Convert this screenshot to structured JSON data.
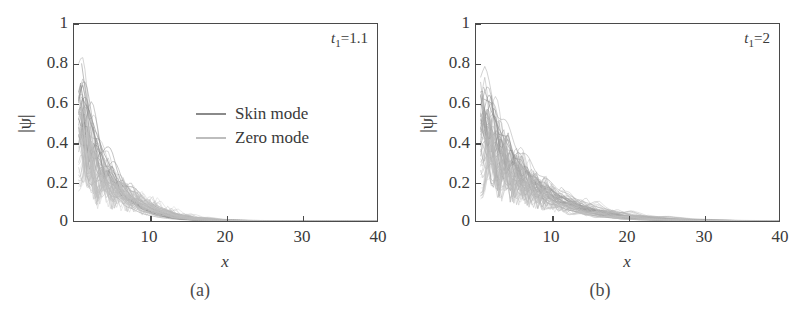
{
  "figure": {
    "panels": [
      {
        "caption": "(a)",
        "annotation": {
          "symbol": "t",
          "subscript": "1",
          "equals": "=",
          "value": "1.1"
        },
        "has_legend": true
      },
      {
        "caption": "(b)",
        "annotation": {
          "symbol": "t",
          "subscript": "1",
          "equals": "=",
          "value": "2"
        },
        "has_legend": false
      }
    ],
    "legend": {
      "items": [
        {
          "label": "Skin mode",
          "color": "#8a8a8a"
        },
        {
          "label": "Zero mode",
          "color": "#bdbdbd"
        }
      ]
    }
  },
  "chart_data": [
    {
      "type": "line",
      "title": "(a)",
      "xlabel": "x",
      "ylabel": "|ψ|",
      "xlim": [
        0,
        40
      ],
      "ylim": [
        0,
        1
      ],
      "xticks": [
        0,
        10,
        20,
        30,
        40
      ],
      "xticklabels": [
        "0",
        "10",
        "20",
        "30",
        "40"
      ],
      "yticks": [
        0,
        0.2,
        0.4,
        0.6,
        0.8,
        1
      ],
      "yticklabels": [
        "0",
        "0.2",
        "0.4",
        "0.6",
        "0.8",
        "1"
      ],
      "grid": false,
      "legend": [
        "Skin mode",
        "Zero mode"
      ],
      "legend_position": "center-right",
      "annotations": [
        "t_1=1.1"
      ],
      "series": [
        {
          "name": "Skin mode",
          "color": "#8a8a8a",
          "x": [
            1,
            2,
            3,
            4,
            5,
            6,
            7,
            8,
            9,
            10,
            11,
            12,
            13,
            14,
            15,
            16,
            18,
            20,
            25,
            30,
            40
          ],
          "values": [
            0.8,
            0.52,
            0.4,
            0.3,
            0.22,
            0.16,
            0.12,
            0.09,
            0.065,
            0.048,
            0.035,
            0.026,
            0.019,
            0.014,
            0.01,
            0.007,
            0.004,
            0.002,
            0.001,
            0.0,
            0.0
          ]
        },
        {
          "name": "Skin mode",
          "color": "#8a8a8a",
          "x": [
            1,
            2,
            3,
            4,
            5,
            6,
            7,
            8,
            9,
            10,
            11,
            12,
            13,
            14,
            15,
            16,
            18,
            20,
            25,
            30,
            40
          ],
          "values": [
            0.63,
            0.56,
            0.44,
            0.34,
            0.26,
            0.2,
            0.15,
            0.11,
            0.085,
            0.063,
            0.046,
            0.034,
            0.025,
            0.018,
            0.013,
            0.01,
            0.005,
            0.003,
            0.001,
            0.0,
            0.0
          ]
        },
        {
          "name": "Skin mode",
          "color": "#8a8a8a",
          "x": [
            1,
            2,
            3,
            4,
            5,
            6,
            7,
            8,
            9,
            10,
            11,
            12,
            13,
            14,
            15,
            16,
            18,
            20,
            25,
            30,
            40
          ],
          "values": [
            0.6,
            0.3,
            0.42,
            0.22,
            0.28,
            0.17,
            0.18,
            0.11,
            0.1,
            0.07,
            0.055,
            0.04,
            0.028,
            0.02,
            0.014,
            0.01,
            0.005,
            0.002,
            0.001,
            0.0,
            0.0
          ]
        },
        {
          "name": "Zero mode",
          "color": "#bdbdbd",
          "x": [
            1,
            2,
            3,
            4,
            5,
            6,
            7,
            8,
            9,
            10,
            11,
            12,
            13,
            14,
            15,
            16,
            18,
            20,
            25,
            30,
            40
          ],
          "values": [
            0.58,
            0.2,
            0.35,
            0.15,
            0.26,
            0.12,
            0.19,
            0.1,
            0.13,
            0.075,
            0.06,
            0.042,
            0.03,
            0.021,
            0.015,
            0.011,
            0.005,
            0.002,
            0.001,
            0.0,
            0.0
          ]
        },
        {
          "name": "Zero mode",
          "color": "#bdbdbd",
          "x": [
            1,
            2,
            3,
            4,
            5,
            6,
            7,
            8,
            9,
            10,
            11,
            12,
            13,
            14,
            15,
            16,
            18,
            20,
            25,
            30,
            40
          ],
          "values": [
            0.45,
            0.42,
            0.12,
            0.27,
            0.1,
            0.2,
            0.08,
            0.14,
            0.06,
            0.095,
            0.04,
            0.055,
            0.025,
            0.03,
            0.016,
            0.014,
            0.006,
            0.003,
            0.001,
            0.0,
            0.0
          ]
        },
        {
          "name": "Zero mode",
          "color": "#bdbdbd",
          "x": [
            1,
            2,
            3,
            4,
            5,
            6,
            7,
            8,
            9,
            10,
            11,
            12,
            13,
            14,
            15,
            16,
            18,
            20,
            25,
            30,
            40
          ],
          "values": [
            0.25,
            0.48,
            0.08,
            0.32,
            0.06,
            0.23,
            0.05,
            0.16,
            0.035,
            0.11,
            0.025,
            0.065,
            0.018,
            0.035,
            0.012,
            0.018,
            0.006,
            0.003,
            0.001,
            0.0,
            0.0
          ]
        }
      ]
    },
    {
      "type": "line",
      "title": "(b)",
      "xlabel": "x",
      "ylabel": "|ψ|",
      "xlim": [
        0,
        40
      ],
      "ylim": [
        0,
        1
      ],
      "xticks": [
        0,
        10,
        20,
        30,
        40
      ],
      "xticklabels": [
        "0",
        "10",
        "20",
        "30",
        "40"
      ],
      "yticks": [
        0,
        0.2,
        0.4,
        0.6,
        0.8,
        1
      ],
      "yticklabels": [
        "0",
        "0.2",
        "0.4",
        "0.6",
        "0.8",
        "1"
      ],
      "grid": false,
      "legend": [],
      "annotations": [
        "t_1=2"
      ],
      "series": [
        {
          "name": "mode-1",
          "color": "#8a8a8a",
          "x": [
            1,
            2,
            3,
            4,
            5,
            6,
            7,
            8,
            9,
            10,
            12,
            14,
            16,
            18,
            20,
            22,
            25,
            30,
            35,
            40
          ],
          "values": [
            0.68,
            0.56,
            0.47,
            0.4,
            0.33,
            0.28,
            0.23,
            0.19,
            0.16,
            0.13,
            0.09,
            0.062,
            0.042,
            0.028,
            0.019,
            0.012,
            0.006,
            0.002,
            0.001,
            0.0
          ]
        },
        {
          "name": "mode-2",
          "color": "#8a8a8a",
          "x": [
            1,
            2,
            3,
            4,
            5,
            6,
            7,
            8,
            9,
            10,
            12,
            14,
            16,
            18,
            20,
            22,
            25,
            30,
            35,
            40
          ],
          "values": [
            0.62,
            0.6,
            0.44,
            0.43,
            0.32,
            0.31,
            0.23,
            0.22,
            0.165,
            0.155,
            0.105,
            0.072,
            0.049,
            0.033,
            0.022,
            0.014,
            0.007,
            0.002,
            0.001,
            0.0
          ]
        },
        {
          "name": "mode-3",
          "color": "#9a9a9a",
          "x": [
            1,
            2,
            3,
            4,
            5,
            6,
            7,
            8,
            9,
            10,
            12,
            14,
            16,
            18,
            20,
            22,
            25,
            30,
            35,
            40
          ],
          "values": [
            0.58,
            0.3,
            0.45,
            0.24,
            0.34,
            0.19,
            0.25,
            0.145,
            0.18,
            0.105,
            0.115,
            0.055,
            0.055,
            0.026,
            0.025,
            0.011,
            0.008,
            0.002,
            0.001,
            0.0
          ]
        },
        {
          "name": "mode-4",
          "color": "#aaaaaa",
          "x": [
            1,
            2,
            3,
            4,
            5,
            6,
            7,
            8,
            9,
            10,
            12,
            14,
            16,
            18,
            20,
            22,
            25,
            30,
            35,
            40
          ],
          "values": [
            0.5,
            0.46,
            0.18,
            0.38,
            0.14,
            0.29,
            0.11,
            0.22,
            0.085,
            0.165,
            0.062,
            0.09,
            0.032,
            0.046,
            0.017,
            0.021,
            0.009,
            0.003,
            0.001,
            0.0
          ]
        },
        {
          "name": "mode-5",
          "color": "#b5b5b5",
          "x": [
            1,
            2,
            3,
            4,
            5,
            6,
            7,
            8,
            9,
            10,
            12,
            14,
            16,
            18,
            20,
            22,
            25,
            30,
            35,
            40
          ],
          "values": [
            0.3,
            0.52,
            0.12,
            0.42,
            0.09,
            0.33,
            0.07,
            0.25,
            0.055,
            0.19,
            0.042,
            0.105,
            0.023,
            0.055,
            0.013,
            0.026,
            0.01,
            0.003,
            0.001,
            0.0
          ]
        },
        {
          "name": "mode-6",
          "color": "#c0c0c0",
          "x": [
            1,
            2,
            3,
            4,
            5,
            6,
            7,
            8,
            9,
            10,
            12,
            14,
            16,
            18,
            20,
            22,
            25,
            30,
            35,
            40
          ],
          "values": [
            0.15,
            0.4,
            0.35,
            0.2,
            0.28,
            0.13,
            0.21,
            0.09,
            0.155,
            0.065,
            0.085,
            0.035,
            0.046,
            0.019,
            0.024,
            0.01,
            0.007,
            0.002,
            0.001,
            0.0
          ]
        }
      ]
    }
  ]
}
